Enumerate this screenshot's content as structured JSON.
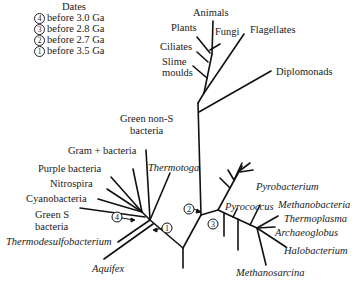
{
  "legend": {
    "title": "Dates",
    "items": [
      {
        "num": "4",
        "text": "before 3.0 Ga"
      },
      {
        "num": "3",
        "text": "before 2.8 Ga"
      },
      {
        "num": "2",
        "text": "before 2.7 Ga"
      },
      {
        "num": "1",
        "text": "before 3.5 Ga"
      }
    ]
  },
  "eukaryotes": {
    "animals": "Animals",
    "plants": "Plants",
    "fungi": "Fungi",
    "flagellates": "Flagellates",
    "ciliates": "Ciliates",
    "slime1": "Slime",
    "slime2": "moulds",
    "diplomonads": "Diplomonads"
  },
  "bacteria": {
    "green_non_s1": "Green non-S",
    "green_non_s2": "bacteria",
    "gram_plus": "Gram + bacteria",
    "purple": "Purple bacteria",
    "nitrospira": "Nitrospira",
    "cyanobacteria": "Cyanobacteria",
    "green_s1": "Green S",
    "green_s2": "bacteria",
    "thermotoga": "Thermotoga",
    "thermodesulfobacterium": "Thermodesulfobacterium",
    "aquifex": "Aquifex"
  },
  "archaea": {
    "pyrobacterium": "Pyrobacterium",
    "pyrococcus": "Pyrococcus",
    "methanobacteria": "Methanobacteria",
    "thermoplasma": "Thermoplasma",
    "archaeoglobus": "Archaeoglobus",
    "halobacterium": "Halobacterium",
    "methanosarcina": "Methanosarcina"
  },
  "markers": {
    "m1": "1",
    "m2": "2",
    "m3": "3",
    "m4": "4"
  }
}
